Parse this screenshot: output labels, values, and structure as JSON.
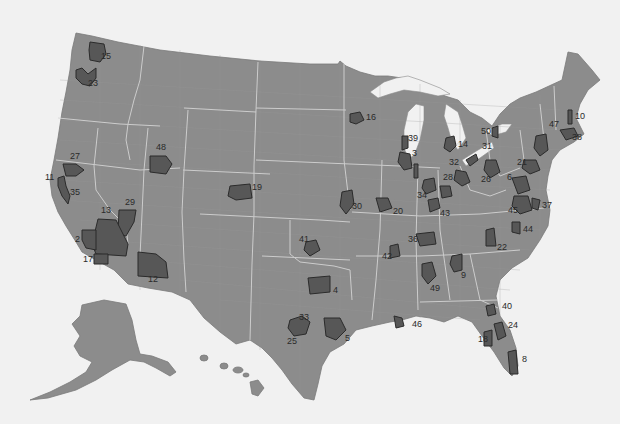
{
  "map": {
    "type": "choropleth-highlight",
    "subject": "United States with numbered highlighted metropolitan regions",
    "colors": {
      "land": "#8c8c8c",
      "region": "#575757",
      "region_border": "#2b2b2b",
      "background": "#f1f1f1",
      "state_lines": "#d8d8d8"
    },
    "regions": [
      {
        "id": "15",
        "label": "15",
        "x": 101,
        "y": 57
      },
      {
        "id": "23",
        "label": "23",
        "x": 88,
        "y": 84
      },
      {
        "id": "48",
        "label": "48",
        "x": 156,
        "y": 148
      },
      {
        "id": "27",
        "label": "27",
        "x": 70,
        "y": 157
      },
      {
        "id": "11",
        "label": "11",
        "x": 45,
        "y": 178
      },
      {
        "id": "35",
        "label": "35",
        "x": 70,
        "y": 193
      },
      {
        "id": "19",
        "label": "19",
        "x": 252,
        "y": 188
      },
      {
        "id": "29",
        "label": "29",
        "x": 125,
        "y": 203
      },
      {
        "id": "13",
        "label": "13",
        "x": 101,
        "y": 211
      },
      {
        "id": "2",
        "label": "2",
        "x": 75,
        "y": 240
      },
      {
        "id": "17",
        "label": "17",
        "x": 83,
        "y": 260
      },
      {
        "id": "12",
        "label": "12",
        "x": 148,
        "y": 280
      },
      {
        "id": "16",
        "label": "16",
        "x": 366,
        "y": 118
      },
      {
        "id": "39",
        "label": "39",
        "x": 408,
        "y": 139
      },
      {
        "id": "3",
        "label": "3",
        "x": 412,
        "y": 154
      },
      {
        "id": "14",
        "label": "14",
        "x": 458,
        "y": 145
      },
      {
        "id": "50",
        "label": "50",
        "x": 481,
        "y": 132
      },
      {
        "id": "31",
        "label": "31",
        "x": 482,
        "y": 147
      },
      {
        "id": "10",
        "label": "10",
        "x": 575,
        "y": 117
      },
      {
        "id": "47",
        "label": "47",
        "x": 549,
        "y": 125
      },
      {
        "id": "38",
        "label": "38",
        "x": 572,
        "y": 138
      },
      {
        "id": "32",
        "label": "32",
        "x": 449,
        "y": 163
      },
      {
        "id": "21",
        "label": "21",
        "x": 517,
        "y": 163
      },
      {
        "id": "26",
        "label": "26",
        "x": 481,
        "y": 180
      },
      {
        "id": "28",
        "label": "28",
        "x": 443,
        "y": 178
      },
      {
        "id": "6",
        "label": "6",
        "x": 507,
        "y": 178
      },
      {
        "id": "34",
        "label": "34",
        "x": 417,
        "y": 196
      },
      {
        "id": "30",
        "label": "30",
        "x": 352,
        "y": 207
      },
      {
        "id": "20",
        "label": "20",
        "x": 393,
        "y": 212
      },
      {
        "id": "43",
        "label": "43",
        "x": 440,
        "y": 214
      },
      {
        "id": "45",
        "label": "45",
        "x": 508,
        "y": 211
      },
      {
        "id": "37",
        "label": "37",
        "x": 542,
        "y": 206
      },
      {
        "id": "36",
        "label": "36",
        "x": 408,
        "y": 240
      },
      {
        "id": "44",
        "label": "44",
        "x": 523,
        "y": 230
      },
      {
        "id": "41",
        "label": "41",
        "x": 299,
        "y": 240
      },
      {
        "id": "22",
        "label": "22",
        "x": 497,
        "y": 248
      },
      {
        "id": "42",
        "label": "42",
        "x": 382,
        "y": 257
      },
      {
        "id": "9",
        "label": "9",
        "x": 461,
        "y": 276
      },
      {
        "id": "49",
        "label": "49",
        "x": 430,
        "y": 289
      },
      {
        "id": "4",
        "label": "4",
        "x": 333,
        "y": 291
      },
      {
        "id": "40",
        "label": "40",
        "x": 502,
        "y": 307
      },
      {
        "id": "33",
        "label": "33",
        "x": 299,
        "y": 318
      },
      {
        "id": "46",
        "label": "46",
        "x": 412,
        "y": 325
      },
      {
        "id": "24",
        "label": "24",
        "x": 508,
        "y": 326
      },
      {
        "id": "25",
        "label": "25",
        "x": 287,
        "y": 342
      },
      {
        "id": "5",
        "label": "5",
        "x": 345,
        "y": 339
      },
      {
        "id": "18",
        "label": "18",
        "x": 478,
        "y": 340
      },
      {
        "id": "8",
        "label": "8",
        "x": 522,
        "y": 360
      }
    ]
  }
}
